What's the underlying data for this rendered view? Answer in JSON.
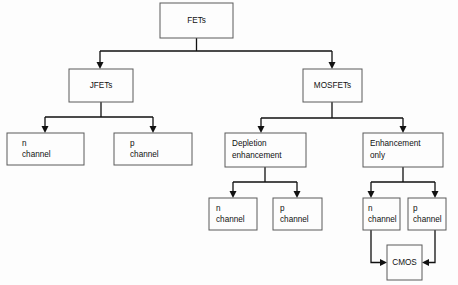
{
  "diagram": {
    "type": "tree-diagram",
    "background_color": "#fdfdfd",
    "box_stroke_color": "#5a5a5a",
    "connector_color": "#111111",
    "text_color": "#111111",
    "nodes": [
      {
        "id": "fets",
        "label_lines": [
          "FETs"
        ],
        "label_line_1": "FETs",
        "align": "center",
        "x": 160,
        "y": 3,
        "w": 73,
        "h": 35
      },
      {
        "id": "jfets",
        "label_lines": [
          "JFETs"
        ],
        "label_line_1": "JFETs",
        "align": "center",
        "x": 69,
        "y": 69,
        "w": 64,
        "h": 33
      },
      {
        "id": "mosfets",
        "label_lines": [
          "MOSFETs"
        ],
        "label_line_1": "MOSFETs",
        "align": "center",
        "x": 303,
        "y": 69,
        "w": 59,
        "h": 33
      },
      {
        "id": "jfet-n-channel",
        "label_lines": [
          "n",
          "channel"
        ],
        "label_line_1": "n",
        "label_line_2": "channel",
        "align": "start",
        "x": 7,
        "y": 133,
        "w": 77,
        "h": 32
      },
      {
        "id": "jfet-p-channel",
        "label_lines": [
          "p",
          "channel"
        ],
        "label_line_1": "p",
        "label_line_2": "channel",
        "align": "start",
        "x": 114,
        "y": 133,
        "w": 78,
        "h": 32
      },
      {
        "id": "depletion-enhancement",
        "label_lines": [
          "Depletion",
          "enhancement"
        ],
        "label_line_1": "Depletion",
        "label_line_2": "enhancement",
        "align": "start",
        "x": 225,
        "y": 133,
        "w": 81,
        "h": 34
      },
      {
        "id": "enhancement-only",
        "label_lines": [
          "Enhancement",
          "only"
        ],
        "label_line_1": "Enhancement",
        "label_line_2": "only",
        "align": "start",
        "x": 363,
        "y": 133,
        "w": 80,
        "h": 34
      },
      {
        "id": "depletion-n-channel",
        "label_lines": [
          "n",
          "channel"
        ],
        "label_line_1": "n",
        "label_line_2": "channel",
        "align": "start",
        "x": 209,
        "y": 198,
        "w": 48,
        "h": 32
      },
      {
        "id": "depletion-p-channel",
        "label_lines": [
          "p",
          "channel"
        ],
        "label_line_1": "p",
        "label_line_2": "channel",
        "align": "start",
        "x": 273,
        "y": 198,
        "w": 49,
        "h": 32
      },
      {
        "id": "enhancement-n-channel",
        "label_lines": [
          "n",
          "channel"
        ],
        "label_line_1": "n",
        "label_line_2": "channel",
        "align": "start",
        "x": 363,
        "y": 198,
        "w": 37,
        "h": 32
      },
      {
        "id": "enhancement-p-channel",
        "label_lines": [
          "p",
          "channel"
        ],
        "label_line_1": "p",
        "label_line_2": "channel",
        "align": "start",
        "x": 408,
        "y": 198,
        "w": 38,
        "h": 32
      },
      {
        "id": "cmos",
        "label_lines": [
          "CMOS"
        ],
        "label_line_1": "CMOS",
        "align": "center",
        "x": 387,
        "y": 245,
        "w": 35,
        "h": 35
      }
    ],
    "edges": [
      {
        "id": "fets-to-jfets",
        "from": "fets",
        "to": "jfets"
      },
      {
        "id": "fets-to-mosfets",
        "from": "fets",
        "to": "mosfets"
      },
      {
        "id": "jfets-to-n-channel",
        "from": "jfets",
        "to": "jfet-n-channel"
      },
      {
        "id": "jfets-to-p-channel",
        "from": "jfets",
        "to": "jfet-p-channel"
      },
      {
        "id": "mosfets-to-depletion",
        "from": "mosfets",
        "to": "depletion-enhancement"
      },
      {
        "id": "mosfets-to-enhancement",
        "from": "mosfets",
        "to": "enhancement-only"
      },
      {
        "id": "depletion-to-n-channel",
        "from": "depletion-enhancement",
        "to": "depletion-n-channel"
      },
      {
        "id": "depletion-to-p-channel",
        "from": "depletion-enhancement",
        "to": "depletion-p-channel"
      },
      {
        "id": "enhancement-to-n-channel",
        "from": "enhancement-only",
        "to": "enhancement-n-channel"
      },
      {
        "id": "enhancement-to-p-channel",
        "from": "enhancement-only",
        "to": "enhancement-p-channel"
      },
      {
        "id": "n-channel-to-cmos",
        "from": "enhancement-n-channel",
        "to": "cmos"
      },
      {
        "id": "p-channel-to-cmos",
        "from": "enhancement-p-channel",
        "to": "cmos"
      }
    ]
  }
}
